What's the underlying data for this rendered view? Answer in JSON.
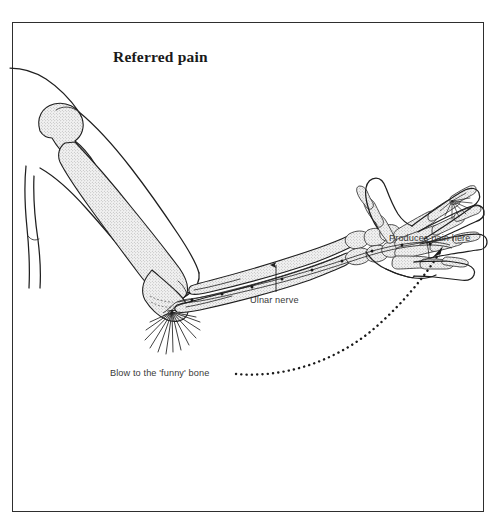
{
  "figure": {
    "title": "Referred pain",
    "frame": {
      "border_color": "#2e2e2e",
      "background": "#ffffff"
    },
    "labels": {
      "ulnar_nerve": "Ulnar nerve",
      "produces_pain_here": "Produces pain here",
      "blow_to_funny_bone": "Blow to the 'funny' bone"
    },
    "colors": {
      "ink": "#1f1f1f",
      "label_ink": "#3a3a3a",
      "bone_fill": "#ededed",
      "stipple_dot": "#9a9a9a",
      "page_background": "#ffffff"
    },
    "annotations": [
      {
        "name": "impact-starburst-elbow",
        "meaning": "site of the blow at the medial epicondyle",
        "center_x": 172,
        "center_y": 312,
        "ray_count": 13
      },
      {
        "name": "pain-starburst-little-finger",
        "meaning": "site where pain is perceived",
        "center_x": 452,
        "center_y": 201,
        "ray_count": 9
      },
      {
        "name": "referred-pain-dotted-arrow",
        "meaning": "curved dotted path from blow site to perceived pain site",
        "start_x": 236,
        "start_y": 374,
        "end_x": 441,
        "end_y": 249,
        "arrowhead": "up-right"
      }
    ],
    "anatomy": [
      "humerus",
      "radius",
      "ulna",
      "carpals",
      "metacarpals",
      "phalanges",
      "ulnar nerve"
    ]
  }
}
